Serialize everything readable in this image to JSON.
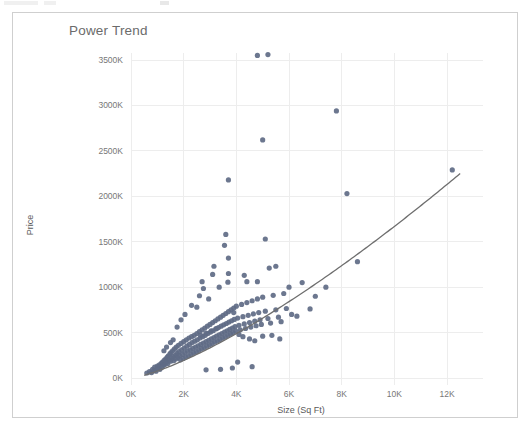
{
  "window": {
    "background_color": "#ffffff",
    "panel_border_color": "#cfcfcf"
  },
  "chart": {
    "title": "Power Trend",
    "title_color": "#6b6b6b",
    "point_color": "#5f6b85",
    "line_color": "#6e6e6e",
    "gridline_color": "#ededed"
  },
  "chart_data": {
    "type": "scatter",
    "title": "Power Trend",
    "xlabel": "Size (Sq Ft)",
    "ylabel": "Price",
    "grid": true,
    "legend": null,
    "xlim": [
      0,
      13000
    ],
    "ylim": [
      0,
      3700000
    ],
    "xticks": [
      0,
      2000,
      4000,
      6000,
      8000,
      10000,
      12000
    ],
    "xticklabels": [
      "0K",
      "2K",
      "4K",
      "6K",
      "8K",
      "10K",
      "12K"
    ],
    "yticks": [
      0,
      500000,
      1000000,
      1500000,
      2000000,
      2500000,
      3000000,
      3500000
    ],
    "yticklabels": [
      "0K",
      "500K",
      "1000K",
      "1500K",
      "2000K",
      "2500K",
      "3000K",
      "3500K"
    ],
    "trend": {
      "label": "Power Trend",
      "type": "power",
      "x_start": 500,
      "x_end": 12500,
      "y_start": 30000,
      "y_end": 2250000
    },
    "points": [
      [
        600,
        55000
      ],
      [
        700,
        70000
      ],
      [
        780,
        60000
      ],
      [
        820,
        95000
      ],
      [
        880,
        85000
      ],
      [
        900,
        120000
      ],
      [
        950,
        75000
      ],
      [
        1000,
        130000
      ],
      [
        1020,
        105000
      ],
      [
        1080,
        145000
      ],
      [
        1100,
        95000
      ],
      [
        1150,
        160000
      ],
      [
        1180,
        120000
      ],
      [
        1200,
        175000
      ],
      [
        1230,
        140000
      ],
      [
        1260,
        195000
      ],
      [
        1300,
        150000
      ],
      [
        1320,
        210000
      ],
      [
        1350,
        175000
      ],
      [
        1380,
        230000
      ],
      [
        1400,
        160000
      ],
      [
        1420,
        245000
      ],
      [
        1450,
        200000
      ],
      [
        1480,
        265000
      ],
      [
        1500,
        185000
      ],
      [
        1520,
        280000
      ],
      [
        1550,
        215000
      ],
      [
        1580,
        300000
      ],
      [
        1600,
        235000
      ],
      [
        1620,
        190000
      ],
      [
        1650,
        320000
      ],
      [
        1680,
        250000
      ],
      [
        1700,
        210000
      ],
      [
        1720,
        340000
      ],
      [
        1750,
        270000
      ],
      [
        1780,
        225000
      ],
      [
        1800,
        360000
      ],
      [
        1820,
        290000
      ],
      [
        1850,
        245000
      ],
      [
        1880,
        200000
      ],
      [
        1900,
        380000
      ],
      [
        1920,
        310000
      ],
      [
        1950,
        260000
      ],
      [
        1980,
        215000
      ],
      [
        2000,
        400000
      ],
      [
        2020,
        330000
      ],
      [
        2050,
        280000
      ],
      [
        2080,
        230000
      ],
      [
        2100,
        420000
      ],
      [
        2120,
        350000
      ],
      [
        2150,
        295000
      ],
      [
        2180,
        245000
      ],
      [
        2200,
        440000
      ],
      [
        2220,
        370000
      ],
      [
        2250,
        310000
      ],
      [
        2280,
        260000
      ],
      [
        2300,
        455000
      ],
      [
        2320,
        390000
      ],
      [
        2350,
        325000
      ],
      [
        2380,
        275000
      ],
      [
        2400,
        470000
      ],
      [
        2420,
        405000
      ],
      [
        2450,
        340000
      ],
      [
        2480,
        290000
      ],
      [
        2500,
        490000
      ],
      [
        2520,
        420000
      ],
      [
        2550,
        355000
      ],
      [
        2580,
        305000
      ],
      [
        2600,
        510000
      ],
      [
        2620,
        440000
      ],
      [
        2650,
        370000
      ],
      [
        2680,
        320000
      ],
      [
        2700,
        530000
      ],
      [
        2720,
        455000
      ],
      [
        2750,
        385000
      ],
      [
        2780,
        335000
      ],
      [
        2800,
        550000
      ],
      [
        2820,
        470000
      ],
      [
        2850,
        400000
      ],
      [
        2880,
        350000
      ],
      [
        2900,
        570000
      ],
      [
        2920,
        490000
      ],
      [
        2950,
        415000
      ],
      [
        2980,
        365000
      ],
      [
        3000,
        590000
      ],
      [
        3020,
        505000
      ],
      [
        3050,
        430000
      ],
      [
        3080,
        380000
      ],
      [
        3100,
        610000
      ],
      [
        3120,
        520000
      ],
      [
        3150,
        445000
      ],
      [
        3180,
        395000
      ],
      [
        3200,
        630000
      ],
      [
        3220,
        540000
      ],
      [
        3250,
        460000
      ],
      [
        3280,
        410000
      ],
      [
        3300,
        650000
      ],
      [
        3320,
        555000
      ],
      [
        3350,
        475000
      ],
      [
        3380,
        425000
      ],
      [
        3400,
        670000
      ],
      [
        3420,
        570000
      ],
      [
        3450,
        490000
      ],
      [
        3480,
        440000
      ],
      [
        3500,
        690000
      ],
      [
        3520,
        585000
      ],
      [
        3550,
        505000
      ],
      [
        3580,
        455000
      ],
      [
        3600,
        710000
      ],
      [
        3620,
        600000
      ],
      [
        3650,
        520000
      ],
      [
        3680,
        470000
      ],
      [
        3700,
        730000
      ],
      [
        3720,
        615000
      ],
      [
        3750,
        535000
      ],
      [
        3780,
        485000
      ],
      [
        3800,
        750000
      ],
      [
        3820,
        630000
      ],
      [
        3850,
        550000
      ],
      [
        3880,
        500000
      ],
      [
        3900,
        770000
      ],
      [
        3920,
        645000
      ],
      [
        3950,
        565000
      ],
      [
        3980,
        515000
      ],
      [
        4000,
        790000
      ],
      [
        4050,
        660000
      ],
      [
        4100,
        580000
      ],
      [
        4150,
        530000
      ],
      [
        4200,
        810000
      ],
      [
        4250,
        675000
      ],
      [
        4300,
        595000
      ],
      [
        4350,
        545000
      ],
      [
        4400,
        830000
      ],
      [
        4450,
        690000
      ],
      [
        4500,
        610000
      ],
      [
        4550,
        560000
      ],
      [
        4600,
        850000
      ],
      [
        4650,
        705000
      ],
      [
        4700,
        625000
      ],
      [
        4750,
        575000
      ],
      [
        4800,
        870000
      ],
      [
        4850,
        720000
      ],
      [
        4900,
        640000
      ],
      [
        4950,
        590000
      ],
      [
        5000,
        890000
      ],
      [
        5100,
        735000
      ],
      [
        5200,
        655000
      ],
      [
        5300,
        605000
      ],
      [
        5400,
        910000
      ],
      [
        5500,
        750000
      ],
      [
        5600,
        670000
      ],
      [
        5700,
        620000
      ],
      [
        5800,
        930000
      ],
      [
        5900,
        765000
      ],
      [
        6000,
        1000000
      ],
      [
        6100,
        700000
      ],
      [
        6300,
        680000
      ],
      [
        6500,
        1050000
      ],
      [
        6800,
        760000
      ],
      [
        7000,
        900000
      ],
      [
        7400,
        1000000
      ],
      [
        8600,
        1280000
      ],
      [
        4800,
        3550000
      ],
      [
        5200,
        3560000
      ],
      [
        7800,
        2940000
      ],
      [
        5000,
        2620000
      ],
      [
        12200,
        2290000
      ],
      [
        8200,
        2030000
      ],
      [
        3700,
        2180000
      ],
      [
        3600,
        1580000
      ],
      [
        5100,
        1530000
      ],
      [
        5250,
        1210000
      ],
      [
        5500,
        1230000
      ],
      [
        3550,
        1460000
      ],
      [
        3700,
        1150000
      ],
      [
        3700,
        1320000
      ],
      [
        3680,
        1055000
      ],
      [
        4300,
        1130000
      ],
      [
        4400,
        1060000
      ],
      [
        4800,
        1060000
      ],
      [
        3100,
        1140000
      ],
      [
        3150,
        1230000
      ],
      [
        2700,
        1060000
      ],
      [
        2750,
        985000
      ],
      [
        3350,
        1000000
      ],
      [
        2950,
        870000
      ],
      [
        3900,
        720000
      ],
      [
        2500,
        780000
      ],
      [
        2300,
        800000
      ],
      [
        2050,
        700000
      ],
      [
        1900,
        640000
      ],
      [
        1750,
        560000
      ],
      [
        2600,
        905000
      ],
      [
        4050,
        175000
      ],
      [
        4600,
        125000
      ],
      [
        3850,
        110000
      ],
      [
        3400,
        95000
      ],
      [
        2850,
        90000
      ],
      [
        1600,
        420000
      ],
      [
        1500,
        390000
      ],
      [
        1350,
        340000
      ],
      [
        1250,
        300000
      ],
      [
        4100,
        480000
      ],
      [
        4250,
        455000
      ],
      [
        4500,
        430000
      ],
      [
        4700,
        410000
      ],
      [
        5000,
        460000
      ],
      [
        5350,
        470000
      ],
      [
        5650,
        430000
      ],
      [
        3250,
        545000
      ],
      [
        3050,
        520000
      ],
      [
        2850,
        495000
      ],
      [
        2650,
        470000
      ]
    ]
  }
}
